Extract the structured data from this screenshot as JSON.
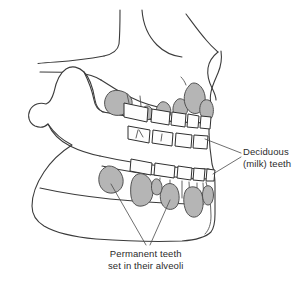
{
  "figure": {
    "background_color": "#ffffff",
    "outline_color": "#3b3b3b",
    "deciduous_tooth_color": "#fdfdfd",
    "permanent_tooth_color": "#b5b5b5",
    "label_text_color": "#2b2b2b"
  },
  "labels": {
    "deciduous": {
      "line1": "Deciduous",
      "line2": "(milk) teeth"
    },
    "permanent": {
      "line1": "Permanent teeth",
      "line2": "set in their alveoli"
    }
  },
  "structures": {
    "maxilla": "maxilla",
    "mandible": "mandible",
    "zygomatic_arch": "zygomatic-arch",
    "condyle": "mandibular-condyle",
    "coronoid_process": "coronoid-process",
    "sigmoid_notch": "mandibular-notch",
    "nasal_profile": "nasal-aperture",
    "chin": "mental-protuberance"
  },
  "counts": {
    "upper_deciduous_teeth": 5,
    "lower_deciduous_teeth": 5,
    "upper_permanent_buds": 6,
    "lower_permanent_buds": 6
  }
}
